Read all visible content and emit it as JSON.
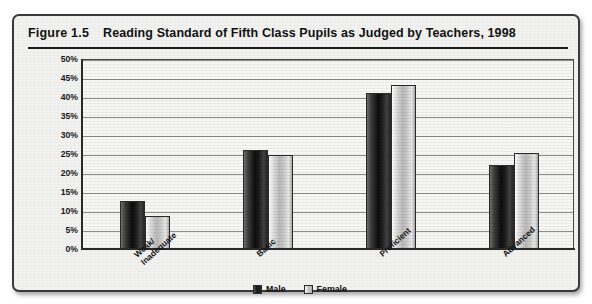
{
  "figure": {
    "number": "Figure 1.5",
    "title": "Reading Standard of Fifth Class Pupils as Judged by Teachers, 1998"
  },
  "legend": {
    "items": [
      {
        "label": "Male",
        "icon": "square-swatch-dark",
        "color": "#111111"
      },
      {
        "label": "Female",
        "icon": "square-swatch-light",
        "color": "#c6c6c6"
      }
    ]
  },
  "axis": {
    "y_ticks": [
      "50%",
      "45%",
      "40%",
      "35%",
      "30%",
      "25%",
      "20%",
      "15%",
      "10%",
      "5%",
      "0%"
    ],
    "y_min": 0,
    "y_max": 50,
    "y_step": 5
  },
  "chart_data": {
    "type": "bar",
    "title": "Reading Standard of Fifth Class Pupils as Judged by Teachers, 1998",
    "xlabel": "",
    "ylabel": "",
    "ylim": [
      0,
      50
    ],
    "ytick_format": "percent",
    "yticks": [
      0,
      5,
      10,
      15,
      20,
      25,
      30,
      35,
      40,
      45,
      50
    ],
    "grid": true,
    "grid_axis": "y",
    "legend_position": "bottom-center",
    "categories": [
      "Weak/\nInadequate",
      "Basic",
      "Proficient",
      "Advanced"
    ],
    "category_labels_flat": [
      "Weak/Inadequate",
      "Basic",
      "Proficient",
      "Advanced"
    ],
    "series": [
      {
        "name": "Male",
        "color": "#111111",
        "values": [
          12.3,
          25.7,
          40.8,
          21.8
        ]
      },
      {
        "name": "Female",
        "color": "#c6c6c6",
        "values": [
          8.5,
          24.4,
          43.0,
          25.0
        ]
      }
    ]
  }
}
